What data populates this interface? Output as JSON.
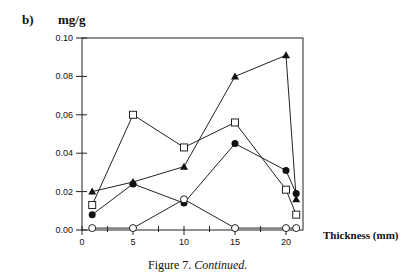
{
  "figure": {
    "panel_label": "b)",
    "unit_label": "mg/g",
    "xlabel": "Thickness (mm)",
    "caption_prefix": "Figure 7. ",
    "caption_italic": "Continued."
  },
  "chart_data": {
    "type": "line",
    "title": "",
    "panel": "b)",
    "xlabel": "Thickness (mm)",
    "ylabel": "mg/g",
    "xlim": [
      0,
      22
    ],
    "ylim": [
      0.0,
      0.1
    ],
    "x_ticks": [
      0,
      5,
      10,
      15,
      20
    ],
    "x_minor_ticks": [
      2.5,
      7.5,
      12.5,
      17.5
    ],
    "y_ticks": [
      "0.00",
      "0.02",
      "0.04",
      "0,06",
      "0.08",
      "0.10"
    ],
    "grid": false,
    "legend": "none",
    "x": [
      1,
      5,
      10,
      15,
      20,
      21
    ],
    "series": [
      {
        "name": "filled triangle",
        "marker": "triangle-filled",
        "values": [
          0.02,
          0.025,
          0.033,
          0.08,
          0.091,
          0.016
        ]
      },
      {
        "name": "open square",
        "marker": "square-open",
        "values": [
          0.013,
          0.06,
          0.043,
          0.056,
          0.021,
          0.008
        ]
      },
      {
        "name": "filled circle",
        "marker": "circle-filled",
        "values": [
          0.008,
          0.024,
          0.014,
          0.045,
          0.031,
          0.019
        ]
      },
      {
        "name": "open circle",
        "marker": "circle-open",
        "values": [
          0.001,
          0.001,
          0.016,
          0.001,
          0.001,
          0.001
        ]
      }
    ]
  }
}
